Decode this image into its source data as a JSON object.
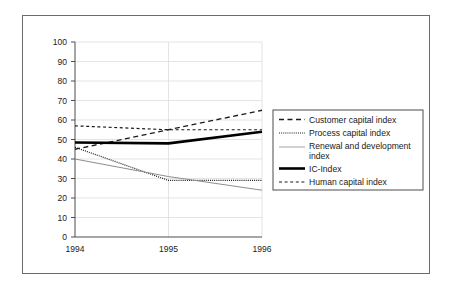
{
  "chart_data": {
    "type": "line",
    "title": "",
    "xlabel": "",
    "ylabel": "",
    "x": [
      "1994",
      "1995",
      "1996"
    ],
    "categories": [
      "1994",
      "1995",
      "1996"
    ],
    "xlim": [
      1994,
      1996
    ],
    "ylim": [
      0,
      100
    ],
    "yticks": [
      0,
      10,
      20,
      30,
      40,
      50,
      60,
      70,
      80,
      90,
      100
    ],
    "xticks": [
      "1994",
      "1995",
      "1996"
    ],
    "grid": "both",
    "legend_position": "right",
    "series": [
      {
        "name": "Customer capital index",
        "style": "long-dash",
        "color": "#1a1a1a",
        "width": 1.3,
        "values": [
          45,
          55,
          65
        ]
      },
      {
        "name": "Process capital index",
        "style": "fine-dot",
        "color": "#1a1a1a",
        "width": 1.2,
        "values": [
          46,
          29,
          29
        ]
      },
      {
        "name": "Renewal  and development index",
        "style": "thin-solid",
        "color": "#8c8c8c",
        "width": 1.0,
        "values": [
          40,
          31,
          24
        ]
      },
      {
        "name": "IC-Index",
        "style": "thick-solid",
        "color": "#000000",
        "width": 2.6,
        "values": [
          48.5,
          48,
          54
        ]
      },
      {
        "name": "Human capital index",
        "style": "short-dash",
        "color": "#1a1a1a",
        "width": 1.2,
        "values": [
          57,
          55,
          55
        ]
      }
    ]
  },
  "axes": {
    "y_tick_labels": [
      "100",
      "90",
      "80",
      "70",
      "60",
      "50",
      "40",
      "30",
      "20",
      "10",
      "0"
    ],
    "x_tick_labels": [
      "1994",
      "1995",
      "1996"
    ]
  },
  "legend": {
    "items": [
      {
        "label": "Customer capital index",
        "style": "long-dash"
      },
      {
        "label": "Process capital index",
        "style": "fine-dot"
      },
      {
        "label": "Renewal  and development",
        "label2": "index",
        "style": "thin-solid"
      },
      {
        "label": "IC-Index",
        "style": "thick-solid"
      },
      {
        "label": "Human capital index",
        "style": "short-dash"
      }
    ]
  }
}
